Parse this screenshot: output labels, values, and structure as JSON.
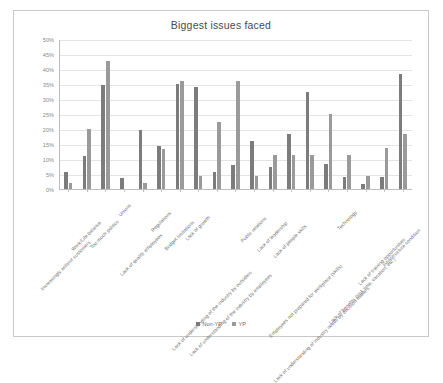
{
  "chart_data": {
    "type": "bar",
    "title": "Biggest issues faced",
    "xlabel": "",
    "ylabel": "",
    "ylim": [
      0,
      50
    ],
    "ytick_labels": [
      "50%",
      "45%",
      "40%",
      "35%",
      "30%",
      "25%",
      "20%",
      "15%",
      "10%",
      "5%",
      "0%"
    ],
    "ytick_values": [
      50,
      45,
      40,
      35,
      30,
      25,
      20,
      15,
      10,
      5,
      0
    ],
    "grid": true,
    "legend_position": "bottom",
    "categories": [
      "Increasingly activist customers",
      "Work/Life balance",
      "Too much politics",
      "Unions",
      "Lack of quality employees",
      "Regulations",
      "Budget limitations",
      "Lack of growth",
      "Lack of understanding of the industry by outsiders",
      "Lack of understanding of the industry by employees",
      "Public relations",
      "Lack of leadership",
      "Lack of people skills",
      "Employees not prepared for workplace (skills)",
      "Lack of understanding of industry needs by decision makers",
      "Technology",
      "Lack of benefits (sick time, vacation, etc.)",
      "Lack of training opportunities",
      "Infrastructure condition"
    ],
    "series": [
      {
        "name": "Non-YP",
        "color": "#7c7c7c",
        "values": [
          6.0,
          11.4,
          35.1,
          4.0,
          20.0,
          14.7,
          35.5,
          34.3,
          6.0,
          8.4,
          16.5,
          7.8,
          18.8,
          32.7,
          8.8,
          4.3,
          2.0,
          4.3,
          38.6
        ]
      },
      {
        "name": "YP",
        "color": "#9a9a9a",
        "values": [
          2.2,
          20.3,
          43.1,
          0.0,
          2.2,
          13.8,
          36.5,
          4.8,
          22.8,
          36.5,
          4.8,
          11.6,
          11.8,
          11.8,
          25.3,
          11.8,
          4.8,
          13.9,
          18.6
        ]
      }
    ]
  },
  "legend": {
    "items": [
      {
        "label": "Non-YP"
      },
      {
        "label": "YP"
      }
    ]
  }
}
